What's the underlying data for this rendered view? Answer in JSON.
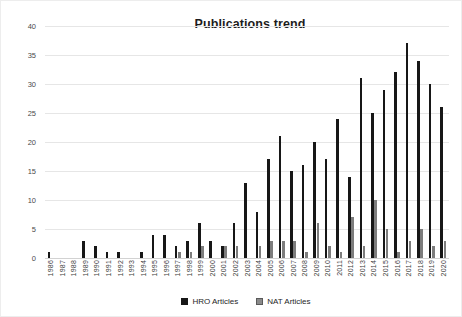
{
  "chart_data": {
    "type": "bar",
    "title": "Publications trend",
    "xlabel": "",
    "ylabel": "",
    "ylim": [
      0,
      40
    ],
    "ytick_step": 5,
    "yticks": [
      "0",
      "5",
      "10",
      "15",
      "20",
      "25",
      "30",
      "35",
      "40"
    ],
    "grid": true,
    "legend_position": "bottom",
    "categories": [
      "1986",
      "1987",
      "1988",
      "1989",
      "1990",
      "1991",
      "1992",
      "1993",
      "1994",
      "1995",
      "1996",
      "1997",
      "1998",
      "1999",
      "2000",
      "2001",
      "2002",
      "2003",
      "2004",
      "2005",
      "2006",
      "2007",
      "2008",
      "2009",
      "2010",
      "2011",
      "2012",
      "2013",
      "2014",
      "2015",
      "2016",
      "2017",
      "2018",
      "2019",
      "2020"
    ],
    "series": [
      {
        "name": "HRO Articles",
        "color": "#171717",
        "values": [
          1,
          0,
          0,
          3,
          2,
          1,
          1,
          0,
          1,
          4,
          4,
          2,
          3,
          6,
          3,
          2,
          6,
          13,
          8,
          17,
          21,
          15,
          16,
          20,
          17,
          24,
          14,
          31,
          25,
          29,
          32,
          37,
          34,
          30,
          26
        ]
      },
      {
        "name": "NAT Articles",
        "color": "#7d7d7d",
        "values": [
          0,
          0,
          0,
          0,
          0,
          0,
          0,
          0,
          0,
          0,
          0,
          1,
          1,
          2,
          0,
          2,
          2,
          0,
          2,
          3,
          3,
          3,
          1,
          6,
          2,
          1,
          7,
          2,
          10,
          5,
          1,
          3,
          5,
          2,
          3
        ]
      }
    ]
  },
  "legend": {
    "items": [
      {
        "label": "HRO Articles",
        "marker": "square-black-icon"
      },
      {
        "label": "NAT Articles",
        "marker": "square-gray-icon"
      }
    ]
  }
}
